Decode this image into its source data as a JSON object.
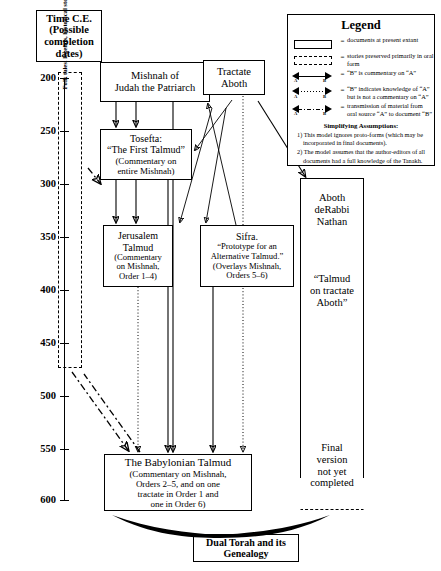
{
  "header": {
    "lines": [
      "Time C.E.",
      "(Possible",
      "completion",
      "dates)"
    ]
  },
  "timeline": {
    "ticks": [
      "200",
      "250",
      "300",
      "350",
      "400",
      "450",
      "500",
      "550",
      "600"
    ],
    "unit": "C.E."
  },
  "oral_box": {
    "text": "Folk tales, legends, historical stories, mostly of the Land of Israel. Most preserved orally, but some in written form in various midrashim.",
    "style": "dashed"
  },
  "documents": {
    "mishnah": {
      "lines": [
        "Mishnah of",
        "Judah the Patriarch"
      ]
    },
    "tosefta": {
      "lines": [
        "Tosefta:",
        "“The First Talmud”",
        "(Commentary on",
        "entire Mishnah)"
      ]
    },
    "jerusalem_talmud": {
      "lines": [
        "Jerusalem",
        "Talmud",
        "(Commentary",
        "on Mishnah,",
        "Order 1–4)"
      ]
    },
    "tractate_aboth": {
      "lines": [
        "Tractate",
        "Aboth"
      ]
    },
    "sifra": {
      "lines": [
        "Sifra.",
        "“Prototype for an",
        "Alternative Talmud.”",
        "(Overlays Mishnah,",
        "Orders 5–6)"
      ]
    },
    "babylonian_talmud": {
      "lines": [
        "The Babylonian Talmud",
        "(Commentary on Mishnah,",
        "Orders 2–5, and on one",
        "tractate in Order 1 and",
        "one in Order 6)"
      ]
    },
    "aboth_derabbi_nathan": {
      "title_lines": [
        "Aboth",
        "deRabbi",
        "Nathan"
      ],
      "subtitle_lines": [
        "“Talmud",
        "on tractate",
        "Aboth”"
      ],
      "status_lines": [
        "Final",
        "version",
        "not yet",
        "completed"
      ]
    }
  },
  "bottom_title": {
    "lines": [
      "Dual Torah and its",
      "Genealogy"
    ]
  },
  "legend": {
    "title": "Legend",
    "equals": "=",
    "entries": [
      {
        "symbol": "solid-rectangle-icon",
        "text": "documents at present extant"
      },
      {
        "symbol": "dashed-rectangle-icon",
        "text": "stories preserved primarily in oral form"
      },
      {
        "symbol": "solid-arrow-icon",
        "from": "A",
        "to": "B",
        "text": "“B” is commentary on “A”"
      },
      {
        "symbol": "dotted-arrow-icon",
        "from": "A",
        "to": "B",
        "text": "“B” indicates knowledge of “A” but is not a commentary on “A”"
      },
      {
        "symbol": "dashdot-arrow-icon",
        "from": "A",
        "to": "B",
        "text": "transmission of material from oral source “A” to document “B”"
      }
    ],
    "assumptions_heading": "Simplifying Assumptions:",
    "assumptions": [
      "1) This model ignores proto-forms (which may be incorporated in final documents).",
      "2) The model assumes that the author-editors of all documents had a full knowledge of the Tanakh."
    ]
  }
}
